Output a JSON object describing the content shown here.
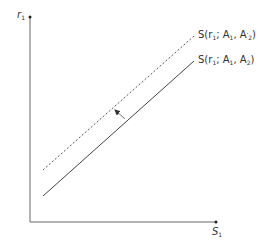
{
  "diagram": {
    "type": "supply-curve-shift",
    "y_axis": {
      "label": "r",
      "label_sub": "1"
    },
    "x_axis": {
      "label": "S",
      "label_sub": "1"
    },
    "curves": [
      {
        "name": "original",
        "style": "solid",
        "label_prefix": "S(r",
        "label_sub1": "1",
        "label_mid": "; A",
        "label_sub2": "1",
        "label_sep": ", A",
        "label_sub3": "2",
        "label_prime": "",
        "label_suffix": ")"
      },
      {
        "name": "shifted",
        "style": "dashed",
        "label_prefix": "S(r",
        "label_sub1": "1",
        "label_mid": "; A",
        "label_sub2": "1",
        "label_sep": ", A",
        "label_sub3": "2",
        "label_prime": "′",
        "label_suffix": ")"
      }
    ],
    "arrow": {
      "direction": "up-left",
      "meaning": "shift from solid to dashed curve"
    },
    "colors": {
      "axis": "#555555",
      "line": "#444444",
      "arrow": "#666666"
    }
  }
}
